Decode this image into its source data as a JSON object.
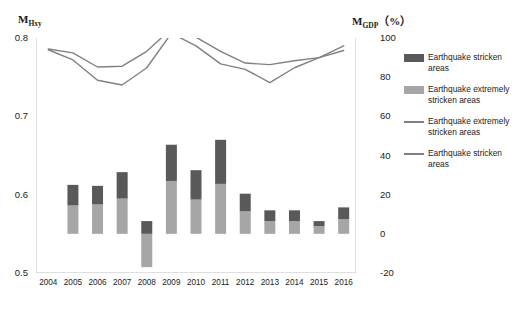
{
  "chart_data": {
    "type": "bar",
    "title": "",
    "categories": [
      "2004",
      "2005",
      "2006",
      "2007",
      "2008",
      "2009",
      "2010",
      "2011",
      "2012",
      "2013",
      "2014",
      "2015",
      "2016"
    ],
    "left_axis": {
      "label": "M_Hxy",
      "ticks": [
        "0.5",
        "0.6",
        "0.7",
        "0.8"
      ],
      "ylim": [
        0.5,
        0.8
      ]
    },
    "right_axis": {
      "label": "M_GDP (%)",
      "ticks": [
        "-20",
        "0",
        "20",
        "40",
        "60",
        "80",
        "100"
      ],
      "ylim": [
        -20,
        100
      ]
    },
    "series": [
      {
        "name": "Earthquake stricken areas",
        "kind": "bar",
        "axis": "right",
        "color": "#595959",
        "values": [
          null,
          10.5,
          9.5,
          13.5,
          6.5,
          18.5,
          15.0,
          22.5,
          9.0,
          5.5,
          5.5,
          2.5,
          6.0
        ]
      },
      {
        "name": "Earthquake extremely stricken areas",
        "kind": "bar",
        "axis": "right",
        "color": "#a6a6a6",
        "values": [
          null,
          14.5,
          15.0,
          18.0,
          -17.0,
          27.0,
          17.5,
          25.5,
          11.5,
          6.5,
          6.5,
          4.0,
          7.5
        ]
      },
      {
        "name": "Earthquake extremely stricken areas",
        "kind": "line",
        "axis": "left",
        "color": "#808080",
        "values": [
          0.785,
          0.772,
          0.746,
          0.74,
          0.762,
          0.806,
          0.79,
          0.767,
          0.76,
          0.743,
          0.762,
          0.775,
          0.79
        ]
      },
      {
        "name": "Earthquake stricken areas",
        "kind": "line",
        "axis": "left",
        "color": "#808080",
        "values": [
          0.786,
          0.781,
          0.763,
          0.764,
          0.783,
          0.812,
          0.801,
          0.783,
          0.768,
          0.766,
          0.771,
          0.775,
          0.784
        ]
      }
    ],
    "legend": {
      "position": "right",
      "entries": [
        {
          "swatch": "bar",
          "color": "#595959",
          "label": "Earthquake stricken areas"
        },
        {
          "swatch": "bar",
          "color": "#a6a6a6",
          "label": "Earthquake extremely stricken areas"
        },
        {
          "swatch": "line",
          "color": "#808080",
          "label": "Earthquake extremely stricken areas"
        },
        {
          "swatch": "line",
          "color": "#808080",
          "label": "Earthquake stricken areas"
        }
      ]
    },
    "grid": false
  },
  "caption": ""
}
